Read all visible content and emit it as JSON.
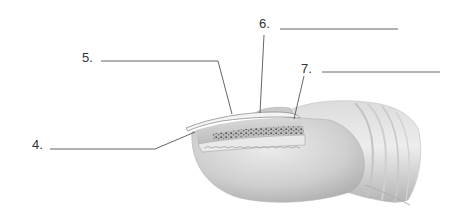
{
  "diagram": {
    "labels": [
      {
        "id": "4",
        "text": "4.",
        "answer": ""
      },
      {
        "id": "5",
        "text": "5.",
        "answer": ""
      },
      {
        "id": "6",
        "text": "6.",
        "answer": ""
      },
      {
        "id": "7",
        "text": "7.",
        "answer": ""
      }
    ]
  },
  "colors": {
    "line": "#555555",
    "label_text": "#333333",
    "skin_light": "#e6e6e6",
    "skin_mid": "#c9c9c9",
    "skin_dark": "#a8a8a8",
    "nail_plate": "#f2f2f2",
    "nail_bed_dots": "#3a3a3a"
  }
}
